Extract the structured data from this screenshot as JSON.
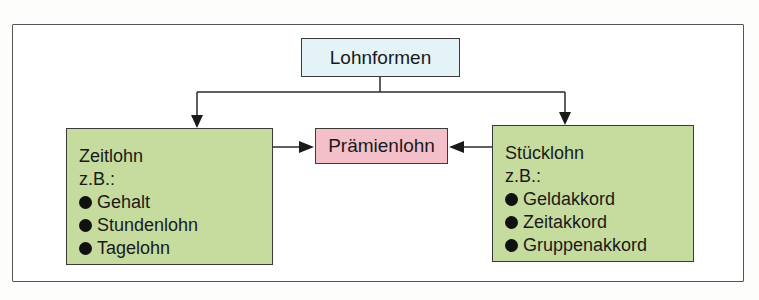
{
  "diagram": {
    "root": {
      "label": "Lohnformen"
    },
    "center": {
      "label": "Prämienlohn"
    },
    "left": {
      "title": "Zeitlohn",
      "subtitle": "z.B.:",
      "items": [
        "Gehalt",
        "Stundenlohn",
        "Tagelohn"
      ]
    },
    "right": {
      "title": "Stücklohn",
      "subtitle": "z.B.:",
      "items": [
        "Geldakkord",
        "Zeitakkord",
        "Gruppenakkord"
      ]
    },
    "colors": {
      "root_fill": "#e3f3f8",
      "center_fill": "#f3bfc9",
      "branch_fill": "#c6dc9e",
      "line": "#2a2a2a"
    }
  }
}
